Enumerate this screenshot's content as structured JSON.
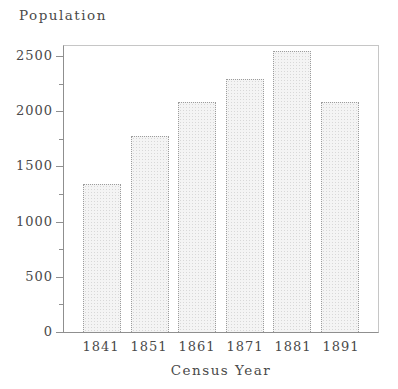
{
  "chart_data": {
    "type": "bar",
    "title": "Population",
    "xlabel": "Census Year",
    "ylabel": "Population",
    "categories": [
      "1841",
      "1851",
      "1861",
      "1871",
      "1881",
      "1891"
    ],
    "values": [
      1340,
      1780,
      2080,
      2290,
      2550,
      2080
    ],
    "ylim": [
      0,
      2600
    ],
    "yticks": [
      0,
      500,
      1000,
      1500,
      2000,
      2500
    ],
    "ytick_labels": [
      "0",
      "500",
      "1000",
      "1500",
      "2000",
      "2500"
    ],
    "minor_yticks": [
      250,
      750,
      1250,
      1750,
      2250
    ],
    "grid": false,
    "legend": false
  },
  "colors": {
    "background": "#ffffff",
    "text": "#4a4a4a",
    "axis": "#8f8f8f",
    "box": "#c6c6c6",
    "bar_fill": "#f4f4f4",
    "bar_dot": "#d8d8d8",
    "bar_border": "#9c9c9c"
  }
}
